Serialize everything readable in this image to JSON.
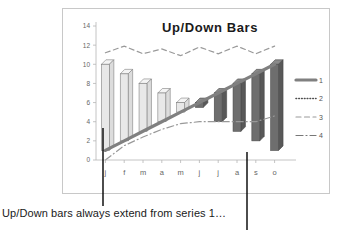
{
  "chart_data": {
    "type": "bar",
    "title": "Up/Down Bars",
    "xlabel": "",
    "ylabel": "",
    "ylim": [
      0,
      14
    ],
    "yticks": [
      0,
      2,
      4,
      6,
      8,
      10,
      12,
      14
    ],
    "categories": [
      "j",
      "f",
      "m",
      "a",
      "m",
      "j",
      "j",
      "a",
      "s",
      "o"
    ],
    "grid": false,
    "legend_position": "right",
    "series": [
      {
        "name": "1",
        "style": "solid-thick",
        "color": "#808080",
        "values": [
          1,
          2,
          3,
          4,
          5,
          6,
          7,
          8,
          9,
          10
        ]
      },
      {
        "name": "2",
        "style": "dotted",
        "color": "#4d4d4d",
        "values": [
          10,
          9,
          8,
          7,
          6,
          5.5,
          4,
          3,
          2,
          1
        ]
      },
      {
        "name": "3",
        "style": "dashed",
        "color": "#999999",
        "values": [
          11.2,
          11.9,
          11.1,
          11.6,
          10.9,
          11.8,
          11.1,
          11.9,
          11.1,
          11.9
        ]
      },
      {
        "name": "4",
        "style": "dash-dot",
        "color": "#999999",
        "values": [
          0,
          1.5,
          2.4,
          3.2,
          3.8,
          4,
          4,
          4,
          4,
          4.6
        ]
      }
    ],
    "updown_bars": {
      "up_fill": "#e8e8e8",
      "up_stroke": "#808080",
      "down_fill": "#6e6e6e",
      "down_stroke": "#4a4a4a",
      "pairs": [
        {
          "category": "j",
          "from": 1,
          "to": 10,
          "direction": "up"
        },
        {
          "category": "f",
          "from": 2,
          "to": 9,
          "direction": "up"
        },
        {
          "category": "m",
          "from": 3,
          "to": 8,
          "direction": "up"
        },
        {
          "category": "a",
          "from": 4,
          "to": 7,
          "direction": "up"
        },
        {
          "category": "m",
          "from": 5,
          "to": 6,
          "direction": "up"
        },
        {
          "category": "j",
          "from": 6,
          "to": 5.5,
          "direction": "down"
        },
        {
          "category": "j",
          "from": 7,
          "to": 4,
          "direction": "down"
        },
        {
          "category": "a",
          "from": 8,
          "to": 3,
          "direction": "down"
        },
        {
          "category": "s",
          "from": 9,
          "to": 2,
          "direction": "down"
        },
        {
          "category": "o",
          "from": 10,
          "to": 1,
          "direction": "down"
        }
      ]
    },
    "legend_entries": [
      {
        "label": "1",
        "style": "solid-thick"
      },
      {
        "label": "2",
        "style": "dotted"
      },
      {
        "label": "3",
        "style": "dashed"
      },
      {
        "label": "4",
        "style": "dash-dot"
      }
    ]
  },
  "caption": {
    "text": "Up/Down bars always extend from series 1…"
  },
  "annotations": {
    "pointer_left": "callout-line-left",
    "pointer_right": "callout-line-right"
  },
  "colors": {
    "frame": "#c8c8c8",
    "axis": "#b5b5b5",
    "tick_text": "#666666",
    "title_text": "#1a1a1a",
    "caption_text": "#1a1a1a",
    "pointer": "#000000"
  }
}
